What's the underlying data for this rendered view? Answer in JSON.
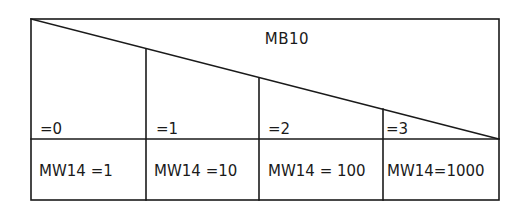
{
  "diagram": {
    "title": "MB10",
    "columns": [
      {
        "condition": "=0",
        "result": "MW14 =1"
      },
      {
        "condition": "=1",
        "result": "MW14 =10"
      },
      {
        "condition": "=2",
        "result": "MW14 = 100"
      },
      {
        "condition": "=3",
        "result": "MW14=1000"
      }
    ]
  }
}
